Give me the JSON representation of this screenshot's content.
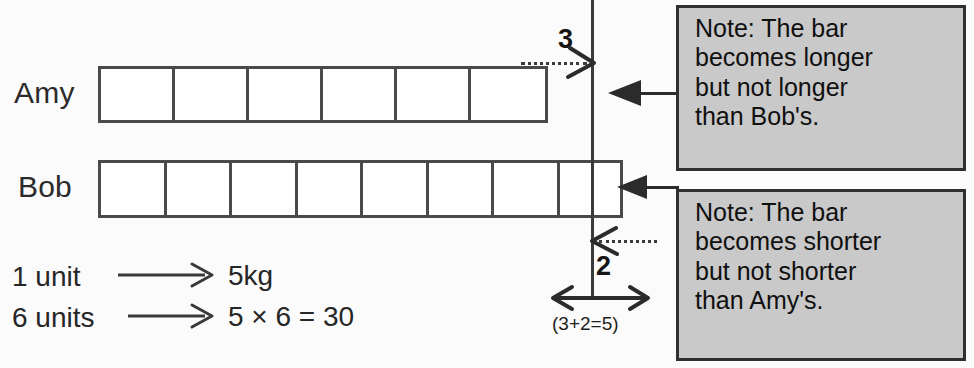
{
  "diagram": {
    "rows": [
      {
        "label": "Amy",
        "units": 6,
        "partial_units": 0
      },
      {
        "label": "Bob",
        "units": 7,
        "partial_units": 1
      }
    ],
    "markers": {
      "upper_value": "3",
      "lower_value": "2",
      "span_caption": "(3+2=5)"
    },
    "notes": [
      {
        "lines": [
          "Note: The bar",
          "becomes longer",
          "but not longer",
          "than Bob's."
        ],
        "target": "Amy"
      },
      {
        "lines": [
          "Note: The bar",
          "becomes shorter",
          "but not shorter",
          "than Amy's."
        ],
        "target": "Bob"
      }
    ],
    "statements": [
      {
        "left": "1 unit",
        "arrow": "⟶",
        "right": "5kg"
      },
      {
        "left": "6 units",
        "arrow": "⟶",
        "right": "5 × 6 = 30"
      }
    ]
  },
  "colors": {
    "bar_stroke": "#4a4a4a",
    "note_fill": "#c9c9c9",
    "note_stroke": "#2f2f2f",
    "ink": "#1a1a1a",
    "page": "#fbfbfb"
  }
}
